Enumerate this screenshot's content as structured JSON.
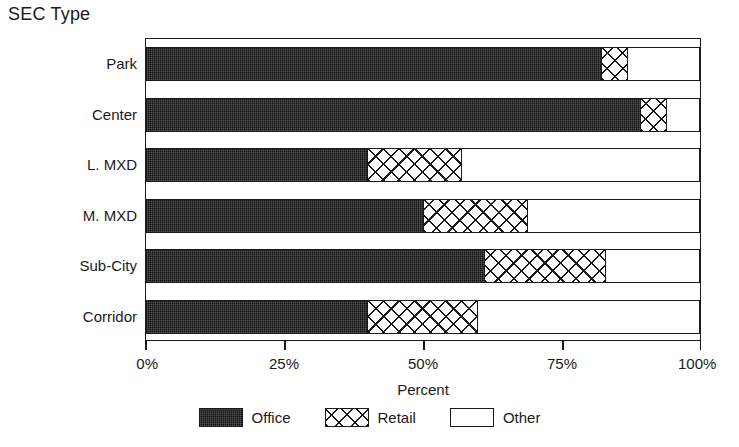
{
  "chart_data": {
    "type": "bar",
    "orientation": "horizontal",
    "stacked": true,
    "title": "SEC Type",
    "xlabel": "Percent",
    "ylabel": "",
    "xlim": [
      0,
      100
    ],
    "grid": false,
    "legend_position": "bottom",
    "categories": [
      "Park",
      "Center",
      "L. MXD",
      "M. MXD",
      "Sub-City",
      "Corridor"
    ],
    "tick_labels": [
      "0%",
      "25%",
      "50%",
      "75%",
      "100%"
    ],
    "tick_values": [
      0,
      25,
      50,
      75,
      100
    ],
    "series": [
      {
        "name": "Office",
        "pattern": "solid-dark",
        "color": "#111111",
        "values": [
          82,
          89,
          40,
          50,
          61,
          40
        ]
      },
      {
        "name": "Retail",
        "pattern": "cross-hatch",
        "color": "#ffffff",
        "values": [
          5,
          5,
          17,
          19,
          22,
          20
        ]
      },
      {
        "name": "Other",
        "pattern": "empty",
        "color": "#ffffff",
        "values": [
          13,
          6,
          43,
          31,
          17,
          40
        ]
      }
    ]
  },
  "legend": {
    "items": [
      {
        "label": "Office"
      },
      {
        "label": "Retail"
      },
      {
        "label": "Other"
      }
    ]
  }
}
